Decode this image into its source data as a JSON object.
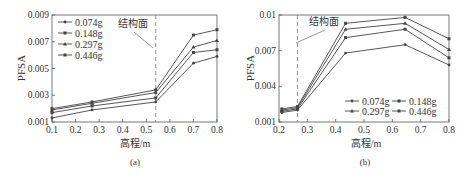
{
  "chart_data": [
    {
      "type": "line",
      "panel_label": "(a)",
      "title": "",
      "xlabel": "高程/m",
      "ylabel": "PFSA",
      "xlim": [
        0.1,
        0.8
      ],
      "ylim": [
        0.001,
        0.009
      ],
      "xticks": [
        0.1,
        0.2,
        0.3,
        0.4,
        0.5,
        0.6,
        0.7,
        0.8
      ],
      "xtick_labels": [
        "0.1",
        "0.2",
        "0.3",
        "0.4",
        "0.5",
        "0.6",
        "0.7",
        "0.8"
      ],
      "yticks": [
        0.001,
        0.003,
        0.005,
        0.007,
        0.009
      ],
      "ytick_labels": [
        "0.001",
        "0.003",
        "0.005",
        "0.007",
        "0.009"
      ],
      "grid": false,
      "legend_position": "upper left",
      "annotation": {
        "text": "结构面",
        "x": 0.54,
        "style": "dashed vertical line"
      },
      "x": [
        0.1,
        0.27,
        0.54,
        0.7,
        0.8
      ],
      "series": [
        {
          "name": "0.074g",
          "values": [
            0.0013,
            0.0019,
            0.0025,
            0.0054,
            0.0059
          ]
        },
        {
          "name": "0.148g",
          "values": [
            0.0017,
            0.0022,
            0.0028,
            0.0062,
            0.0064
          ]
        },
        {
          "name": "0.297g",
          "values": [
            0.0019,
            0.0024,
            0.0032,
            0.0066,
            0.0071
          ]
        },
        {
          "name": "0.446g",
          "values": [
            0.002,
            0.0025,
            0.0034,
            0.0075,
            0.0079
          ]
        }
      ]
    },
    {
      "type": "line",
      "panel_label": "(b)",
      "title": "",
      "xlabel": "高程/m",
      "ylabel": "PFSA",
      "xlim": [
        0.2,
        0.8
      ],
      "ylim": [
        0.001,
        0.01
      ],
      "xticks": [
        0.2,
        0.3,
        0.4,
        0.5,
        0.6,
        0.7,
        0.8
      ],
      "xtick_labels": [
        "0.2",
        "0.3",
        "0.4",
        "0.5",
        "0.6",
        "0.7",
        "0.8"
      ],
      "yticks": [
        0.001,
        0.004,
        0.007,
        0.01
      ],
      "ytick_labels": [
        "0.001",
        "0.004",
        "0.007",
        "0.01"
      ],
      "grid": false,
      "legend_position": "lower right",
      "annotation": {
        "text": "结构面",
        "x": 0.265,
        "style": "dashed vertical line"
      },
      "x": [
        0.21,
        0.265,
        0.435,
        0.645,
        0.8
      ],
      "series": [
        {
          "name": "0.074g",
          "values": [
            0.0018,
            0.002,
            0.0068,
            0.0075,
            0.0058
          ]
        },
        {
          "name": "0.148g",
          "values": [
            0.0019,
            0.0021,
            0.0081,
            0.0088,
            0.0064
          ]
        },
        {
          "name": "0.297g",
          "values": [
            0.002,
            0.0022,
            0.0088,
            0.0093,
            0.0071
          ]
        },
        {
          "name": "0.446g",
          "values": [
            0.0021,
            0.0023,
            0.0093,
            0.0098,
            0.008
          ]
        }
      ]
    }
  ],
  "panels": {
    "a": {
      "caption": "(a)",
      "xlabel": "高程/m",
      "ylabel": "PFSA",
      "annotation": "结构面"
    },
    "b": {
      "caption": "(b)",
      "xlabel": "高程/m",
      "ylabel": "PFSA",
      "annotation": "结构面"
    }
  },
  "colors": {
    "line": "#444444",
    "axis": "#555555",
    "dashed": "#777777"
  }
}
